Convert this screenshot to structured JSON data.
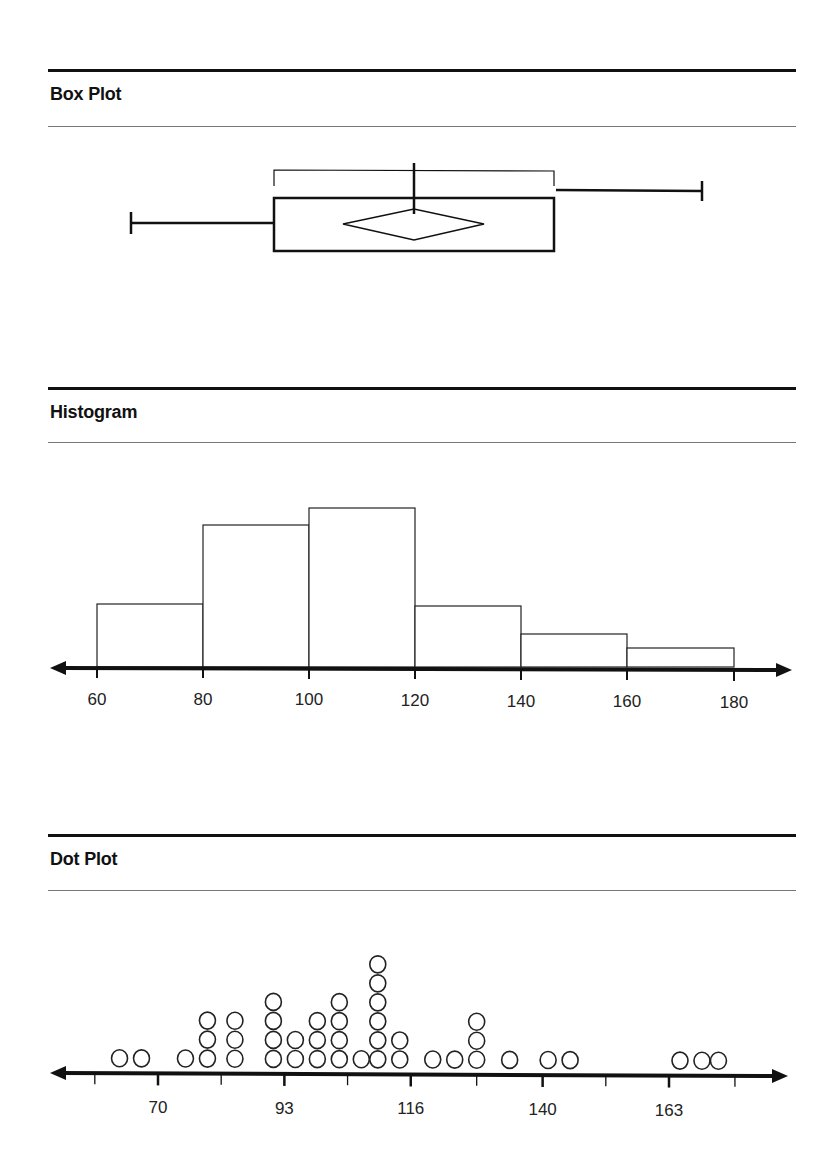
{
  "sections": {
    "box_plot": {
      "title": "Box Plot"
    },
    "histogram": {
      "title": "Histogram"
    },
    "dot_plot": {
      "title": "Dot Plot"
    }
  },
  "chart_data": [
    {
      "type": "box",
      "title": "Box Plot",
      "xlabel": "",
      "ylabel": "",
      "summary": {
        "min": 66,
        "q1": 93,
        "median": 120,
        "mean": 120,
        "q3": 146,
        "max": 174
      },
      "mean_diamond": true,
      "shortest_half_bracket": [
        93,
        146
      ],
      "note": "Values estimated against the histogram's 60–180 scale; the plot has no axis labels."
    },
    {
      "type": "bar",
      "subtype": "histogram",
      "title": "Histogram",
      "categories": [
        "60-80",
        "80-100",
        "100-120",
        "120-140",
        "140-160",
        "160-180"
      ],
      "bin_edges": [
        60,
        80,
        100,
        120,
        140,
        160,
        180
      ],
      "values": [
        4,
        9,
        10,
        4,
        2,
        1
      ],
      "relative_heights_px": [
        63,
        142,
        159,
        61,
        33,
        19
      ],
      "x_ticks": [
        "60",
        "80",
        "100",
        "120",
        "140",
        "160",
        "180"
      ],
      "xlim": [
        55,
        190
      ],
      "xlabel": "",
      "ylabel": "",
      "grid": false
    },
    {
      "type": "scatter",
      "subtype": "dot_plot",
      "title": "Dot Plot",
      "x": [
        63,
        67,
        75,
        79,
        84,
        91,
        95,
        99,
        103,
        107,
        110,
        114,
        120,
        124,
        128,
        134,
        141,
        145,
        165,
        169,
        172
      ],
      "counts": [
        1,
        1,
        1,
        3,
        3,
        4,
        2,
        3,
        4,
        1,
        6,
        2,
        1,
        1,
        3,
        1,
        1,
        1,
        1,
        1,
        1
      ],
      "total": 41,
      "x_ticks": [
        "70",
        "93",
        "116",
        "140",
        "163"
      ],
      "x_tick_values": [
        70,
        93,
        116,
        140,
        163
      ],
      "minor_ticks": [
        58.5,
        81.5,
        104.5,
        128,
        151.5,
        175
      ],
      "xlim": [
        48,
        190
      ],
      "xlabel": "",
      "ylabel": "",
      "grid": false
    }
  ]
}
